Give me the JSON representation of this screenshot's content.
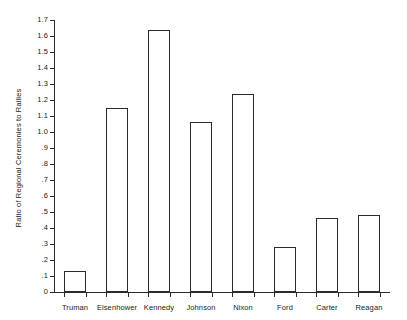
{
  "chart_data": {
    "type": "bar",
    "title": "",
    "xlabel": "",
    "ylabel": "Ratio of Regional Ceremonies to Rallies",
    "categories": [
      "Truman",
      "Eisenhower",
      "Kennedy",
      "Johnson",
      "Nixon",
      "Ford",
      "Carter",
      "Reagan"
    ],
    "values": [
      0.13,
      1.15,
      1.64,
      1.06,
      1.24,
      0.28,
      0.46,
      0.48
    ],
    "ylim": [
      0,
      1.7
    ],
    "ytick_values": [
      0,
      0.1,
      0.2,
      0.3,
      0.4,
      0.5,
      0.6,
      0.7,
      0.8,
      0.9,
      1.0,
      1.1,
      1.2,
      1.3,
      1.4,
      1.5,
      1.6,
      1.7
    ],
    "ytick_labels": [
      "0",
      ".1",
      ".2",
      ".3",
      ".4",
      ".5",
      ".6",
      ".7",
      ".8",
      ".9",
      "1.0",
      "1.1",
      "1.2",
      "1.3",
      "1.4",
      "1.5",
      "1.6",
      "1.7"
    ],
    "grid": false,
    "legend": null,
    "bar_fill_color": "#ffffff",
    "bar_edge_color": "#2b2b2b",
    "axis_color": "#2b2b2b",
    "background_color": "#ffffff"
  }
}
